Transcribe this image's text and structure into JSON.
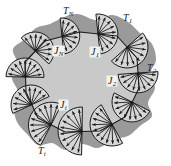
{
  "figure": {
    "type": "diagram",
    "colors": {
      "background": "#ffffff",
      "outer_blob": "#9a9a9a",
      "polygon_fill": "#c9c9c9",
      "fan_fill": "#d6d6d6",
      "stroke": "#1a1a1a",
      "label_box": "#f2f2f2"
    },
    "edge_labels": [
      {
        "id": "T_N",
        "base": "T",
        "sub": "N",
        "x": 63,
        "y": 6
      },
      {
        "id": "T_1",
        "base": "T",
        "sub": "1",
        "x": 123,
        "y": 13
      },
      {
        "id": "T_2",
        "base": "T",
        "sub": "2",
        "x": 147,
        "y": 63
      },
      {
        "id": "T_i",
        "base": "T",
        "sub": "i",
        "x": 38,
        "y": 146
      }
    ],
    "fan_labels": [
      {
        "id": "J_N",
        "base": "J",
        "sub": "N",
        "x": 53,
        "y": 46
      },
      {
        "id": "J_1",
        "base": "J",
        "sub": "1",
        "x": 90,
        "y": 47
      },
      {
        "id": "J_2",
        "base": "J",
        "sub": "2",
        "x": 107,
        "y": 76
      },
      {
        "id": "J_i",
        "base": "J",
        "sub": "i",
        "x": 59,
        "y": 100
      }
    ],
    "polygon_vertices": [
      [
        80,
        32
      ],
      [
        117,
        36
      ],
      [
        137,
        58
      ],
      [
        139,
        88
      ],
      [
        125,
        117
      ],
      [
        100,
        131
      ],
      [
        65,
        132
      ],
      [
        38,
        118
      ],
      [
        26,
        92
      ],
      [
        25,
        62
      ],
      [
        45,
        41
      ]
    ],
    "blob_outline": [
      [
        78,
        14
      ],
      [
        96,
        20
      ],
      [
        112,
        15
      ],
      [
        128,
        22
      ],
      [
        140,
        33
      ],
      [
        152,
        44
      ],
      [
        156,
        60
      ],
      [
        150,
        74
      ],
      [
        155,
        88
      ],
      [
        148,
        103
      ],
      [
        152,
        116
      ],
      [
        140,
        126
      ],
      [
        128,
        136
      ],
      [
        112,
        140
      ],
      [
        98,
        148
      ],
      [
        82,
        144
      ],
      [
        66,
        150
      ],
      [
        52,
        143
      ],
      [
        38,
        145
      ],
      [
        27,
        134
      ],
      [
        17,
        122
      ],
      [
        14,
        107
      ],
      [
        18,
        92
      ],
      [
        12,
        78
      ],
      [
        17,
        63
      ],
      [
        13,
        49
      ],
      [
        25,
        39
      ],
      [
        36,
        28
      ],
      [
        50,
        24
      ],
      [
        64,
        17
      ]
    ],
    "fans": [
      {
        "cx": 98,
        "cy": 34,
        "r": 20,
        "angle": -6,
        "rays": 9
      },
      {
        "cx": 127,
        "cy": 47,
        "r": 21,
        "angle": 48,
        "rays": 9
      },
      {
        "cx": 138,
        "cy": 73,
        "r": 20,
        "angle": 86,
        "rays": 9
      },
      {
        "cx": 132,
        "cy": 102,
        "r": 20,
        "angle": 117,
        "rays": 9
      },
      {
        "cx": 112,
        "cy": 124,
        "r": 22,
        "angle": 151,
        "rays": 10
      },
      {
        "cx": 82,
        "cy": 131,
        "r": 24,
        "angle": 181,
        "rays": 10
      },
      {
        "cx": 51,
        "cy": 125,
        "r": 23,
        "angle": 207,
        "rays": 10
      },
      {
        "cx": 31,
        "cy": 105,
        "r": 20,
        "angle": 245,
        "rays": 9
      },
      {
        "cx": 25,
        "cy": 77,
        "r": 19,
        "angle": 271,
        "rays": 9
      },
      {
        "cx": 35,
        "cy": 51,
        "r": 19,
        "angle": 313,
        "rays": 9
      },
      {
        "cx": 62,
        "cy": 36,
        "r": 18,
        "angle": 354,
        "rays": 8
      }
    ]
  }
}
